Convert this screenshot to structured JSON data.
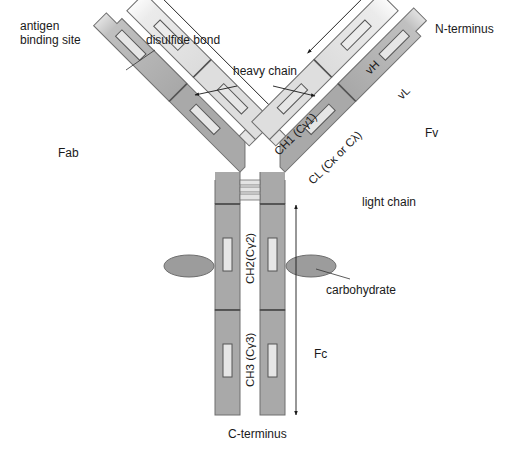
{
  "diagram": {
    "colors": {
      "heavy_chain_fill": "#a9a9a9",
      "heavy_chain_light": "#c4c4c4",
      "light_chain_fill": "#dedede",
      "light_chain_pale": "#f0f0f0",
      "disulfide_fill": "#e6e6e6",
      "carbohydrate_fill": "#9a9a9a",
      "outline": "#6e6e6e",
      "text": "#1a1a1a"
    },
    "labels": {
      "antigen_binding_site": [
        "antigen",
        "binding site"
      ],
      "disulfide_bond": "disulfide bond",
      "heavy_chain": "heavy chain",
      "n_terminus": "N-terminus",
      "vh": "vH",
      "vl": "vL",
      "ch1": "CH1 (Cγ1)",
      "cl": "CL (Cκ or Cλ)",
      "fv": "Fv",
      "fab": "Fab",
      "light_chain": "light chain",
      "ch2": "CH2(Cγ2)",
      "ch3": "CH3 (Cγ3)",
      "carbohydrate": "carbohydrate",
      "fc": "Fc",
      "c_terminus": "C-terminus"
    },
    "components": [
      {
        "name": "heavy chain",
        "count": 2,
        "domains": [
          "vH",
          "CH1 (Cγ1)",
          "CH2(Cγ2)",
          "CH3 (Cγ3)"
        ]
      },
      {
        "name": "light chain",
        "count": 2,
        "domains": [
          "vL",
          "CL (Cκ or Cλ)"
        ]
      },
      {
        "name": "carbohydrate",
        "count": 2,
        "attached_to": "CH2(Cγ2)"
      },
      {
        "name": "hinge disulfide bonds",
        "count": 3
      }
    ],
    "regions": [
      {
        "name": "Fab",
        "spans": "left arm"
      },
      {
        "name": "Fv",
        "spans": "variable domains vH + vL"
      },
      {
        "name": "Fc",
        "spans": "CH2 + CH3 stem"
      }
    ]
  }
}
